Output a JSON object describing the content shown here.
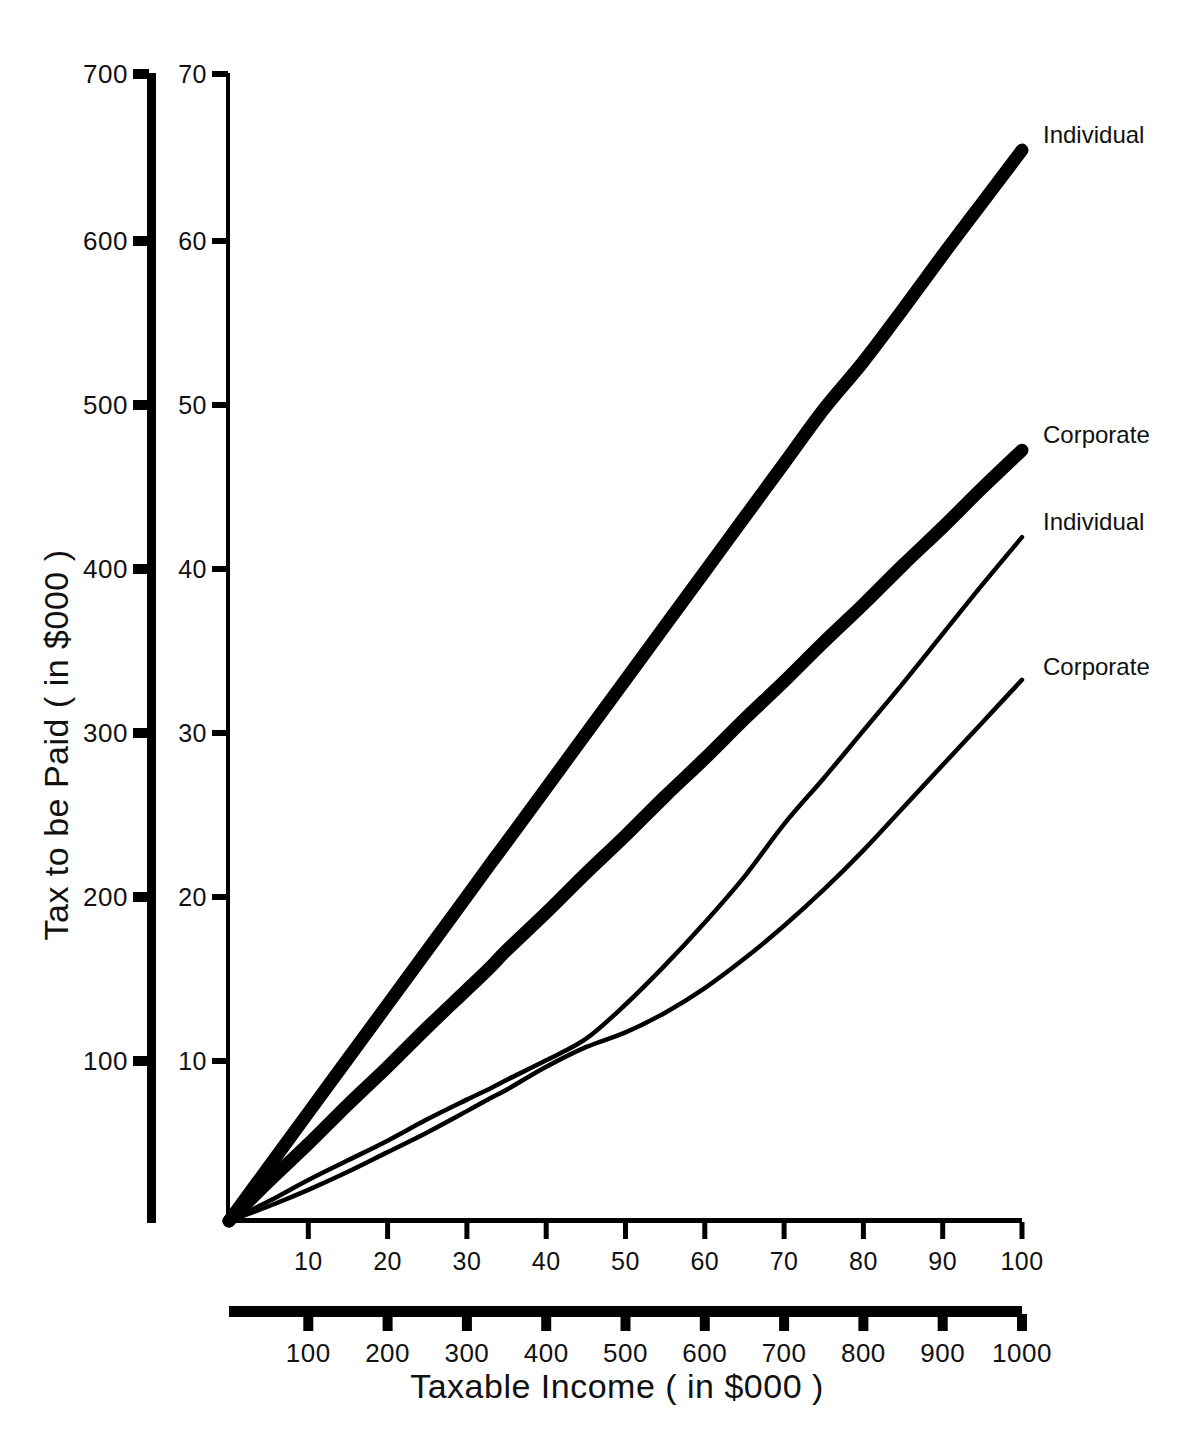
{
  "chart_data": {
    "type": "line",
    "title": "",
    "xlabel": "Taxable  Income ( in  $000 )",
    "ylabel": "Tax to be Paid ( in $000 )",
    "grid": false,
    "legend_position": "right-of-line-ends",
    "axes": {
      "x_inner": {
        "name": "taxable-income-small-scale",
        "ticks": [
          10,
          20,
          30,
          40,
          50,
          60,
          70,
          80,
          90,
          100
        ],
        "tick_labels": [
          "10",
          "20",
          "30",
          "40",
          "50",
          "60",
          "70",
          "80",
          "90",
          "100"
        ],
        "range": [
          0,
          100
        ],
        "weight": "thin"
      },
      "x_outer": {
        "name": "taxable-income-large-scale",
        "ticks": [
          100,
          200,
          300,
          400,
          500,
          600,
          700,
          800,
          900,
          1000
        ],
        "tick_labels": [
          "100",
          "200",
          "300",
          "400",
          "500",
          "600",
          "700",
          "800",
          "900",
          "1000"
        ],
        "range": [
          0,
          1000
        ],
        "weight": "thick"
      },
      "y_inner": {
        "name": "tax-small-scale",
        "ticks": [
          10,
          20,
          30,
          40,
          50,
          60,
          70
        ],
        "tick_labels": [
          "10",
          "20",
          "30",
          "40",
          "50",
          "60",
          "70"
        ],
        "range": [
          0,
          70
        ],
        "weight": "thin"
      },
      "y_outer": {
        "name": "tax-large-scale",
        "ticks": [
          100,
          200,
          300,
          400,
          500,
          600,
          700
        ],
        "tick_labels": [
          "100",
          "200",
          "300",
          "400",
          "500",
          "600",
          "700"
        ],
        "range": [
          0,
          700
        ],
        "weight": "thick"
      }
    },
    "x": [
      0,
      5,
      10,
      15,
      20,
      25,
      30,
      33,
      35,
      40,
      45,
      50,
      55,
      60,
      65,
      70,
      75,
      80,
      85,
      90,
      95,
      100
    ],
    "series": [
      {
        "name": "Individual (large scale)",
        "label": "Individual",
        "stroke_weight": "thick",
        "scale": "outer",
        "values": [
          0,
          3.3,
          6.6,
          9.9,
          13.2,
          16.5,
          19.8,
          21.8,
          23.1,
          26.4,
          29.7,
          33.0,
          36.3,
          39.6,
          42.9,
          46.2,
          49.5,
          52.4,
          55.6,
          58.9,
          62.1,
          65.3
        ]
      },
      {
        "name": "Corporate (large scale)",
        "label": "Corporate",
        "stroke_weight": "thick",
        "scale": "outer",
        "values": [
          0,
          2.4,
          4.7,
          7.1,
          9.4,
          11.8,
          14.1,
          15.5,
          16.5,
          18.8,
          21.2,
          23.5,
          25.9,
          28.2,
          30.6,
          32.9,
          35.3,
          37.6,
          40.0,
          42.3,
          44.7,
          47.0
        ]
      },
      {
        "name": "Individual (small scale)",
        "label": "Individual",
        "stroke_weight": "thin",
        "scale": "inner",
        "values": [
          0,
          1.2,
          2.5,
          3.7,
          4.9,
          6.2,
          7.4,
          8.1,
          8.6,
          9.8,
          11.1,
          13.2,
          15.6,
          18.2,
          21.0,
          24.2,
          27.0,
          29.9,
          32.8,
          35.8,
          38.8,
          41.7
        ]
      },
      {
        "name": "Corporate (small scale)",
        "label": "Corporate",
        "stroke_weight": "thin",
        "scale": "inner",
        "values": [
          0,
          0.9,
          1.9,
          3.0,
          4.2,
          5.4,
          6.7,
          7.5,
          8.0,
          9.4,
          10.6,
          11.5,
          12.7,
          14.2,
          16.0,
          18.0,
          20.2,
          22.6,
          25.2,
          27.8,
          30.4,
          33.0
        ]
      }
    ],
    "series_labels": [
      {
        "text": "Individual",
        "x_px": 1043,
        "y_px": 143
      },
      {
        "text": "Corporate",
        "x_px": 1043,
        "y_px": 443
      },
      {
        "text": "Individual",
        "x_px": 1043,
        "y_px": 530
      },
      {
        "text": "Corporate",
        "x_px": 1043,
        "y_px": 675
      }
    ],
    "colors": {
      "ink": "#000000",
      "background": "#ffffff"
    }
  }
}
